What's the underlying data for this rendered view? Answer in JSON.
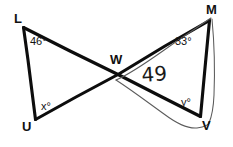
{
  "figure": {
    "type": "geometry-diagram",
    "background_color": "#ffffff",
    "ink_color": "#0d0d0d",
    "annotation_ink_color": "#5b5b5b",
    "canvas": {
      "width": 233,
      "height": 147
    },
    "vertices": [
      {
        "id": "L",
        "label": "L",
        "x": 23,
        "y": 27,
        "label_x": 14,
        "label_y": 23
      },
      {
        "id": "U",
        "label": "U",
        "x": 35,
        "y": 120,
        "label_x": 22,
        "label_y": 131
      },
      {
        "id": "W",
        "label": "W",
        "x": 118,
        "y": 74,
        "label_x": 110,
        "label_y": 64
      },
      {
        "id": "M",
        "label": "M",
        "x": 210,
        "y": 20,
        "label_x": 208,
        "label_y": 14
      },
      {
        "id": "V",
        "label": "V",
        "x": 200,
        "y": 117,
        "label_x": 203,
        "label_y": 128
      }
    ],
    "segments": [
      {
        "id": "L-U",
        "from": "L",
        "to": "U",
        "style": "main"
      },
      {
        "id": "L-W-V",
        "from": "L",
        "to": "V",
        "style": "main",
        "note": "passes through W"
      },
      {
        "id": "U-W-M",
        "from": "U",
        "to": "M",
        "style": "main",
        "note": "passes through W"
      },
      {
        "id": "M-V",
        "from": "M",
        "to": "V",
        "style": "main"
      }
    ],
    "angles": [
      {
        "id": "angle-L",
        "at_vertex": "L",
        "text": "46°",
        "value": 46,
        "x": 30,
        "y": 45
      },
      {
        "id": "angle-U",
        "at_vertex": "U",
        "text": "x°",
        "value": "x",
        "x": 41,
        "y": 110
      },
      {
        "id": "angle-M",
        "at_vertex": "M",
        "text": "33°",
        "value": 33,
        "x": 175,
        "y": 45
      },
      {
        "id": "angle-V",
        "at_vertex": "V",
        "text": "y°",
        "value": "y",
        "x": 181,
        "y": 106
      }
    ],
    "annotations": [
      {
        "id": "handwritten-49",
        "text": "49",
        "x": 142,
        "y": 82
      }
    ]
  }
}
